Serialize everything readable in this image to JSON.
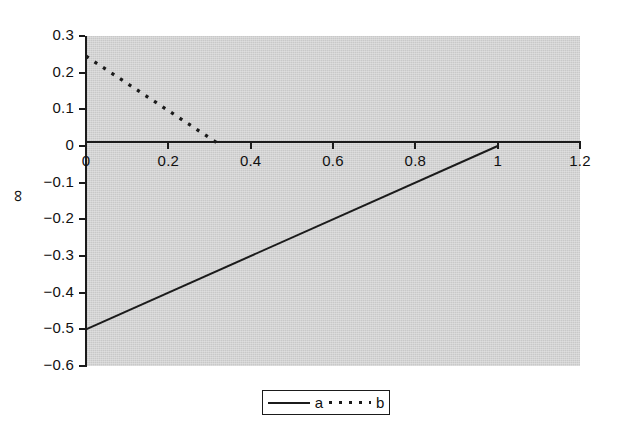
{
  "chart_data": {
    "type": "line",
    "title": "",
    "xlabel": "",
    "ylabel": "∞",
    "xlim": [
      0,
      1.2
    ],
    "ylim": [
      -0.6,
      0.3
    ],
    "grid": false,
    "legend_position": "bottom-center",
    "plot_background": "#d2d2d2",
    "line_color": "#1b1b1b",
    "x_ticks": [
      "0",
      "0.2",
      "0.4",
      "0.6",
      "0.8",
      "1",
      "1.2"
    ],
    "x_tick_values": [
      0,
      0.2,
      0.4,
      0.6,
      0.8,
      1,
      1.2
    ],
    "y_ticks": [
      "0.3",
      "0.2",
      "0.1",
      "0",
      "−0.1",
      "−0.2",
      "−0.3",
      "−0.4",
      "−0.5",
      "−0.6"
    ],
    "y_tick_values": [
      0.3,
      0.2,
      0.1,
      0,
      -0.1,
      -0.2,
      -0.3,
      -0.4,
      -0.5,
      -0.6
    ],
    "series": [
      {
        "name": "a",
        "style": "solid",
        "x": [
          0,
          1
        ],
        "values": [
          -0.5,
          0
        ]
      },
      {
        "name": "b",
        "style": "dotted",
        "x": [
          0,
          0.33
        ],
        "values": [
          0.245,
          0
        ]
      }
    ]
  },
  "legend": {
    "entries": [
      {
        "label": "a",
        "style": "solid"
      },
      {
        "label": "b",
        "style": "dotted"
      }
    ]
  }
}
